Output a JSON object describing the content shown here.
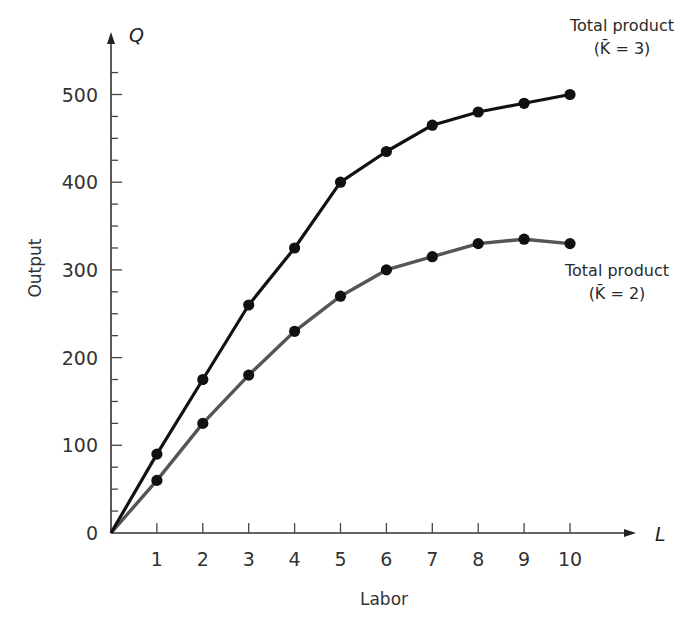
{
  "chart_data": {
    "type": "line",
    "title": "",
    "xlabel": "Labor",
    "ylabel": "Output",
    "x_axis_symbol": "L",
    "y_axis_symbol": "Q",
    "x": [
      1,
      2,
      3,
      4,
      5,
      6,
      7,
      8,
      9,
      10
    ],
    "xticks": [
      "1",
      "2",
      "3",
      "4",
      "5",
      "6",
      "7",
      "8",
      "9",
      "10"
    ],
    "yticks": [
      "0",
      "100",
      "200",
      "300",
      "400",
      "500"
    ],
    "y_minor_tick_step": 25,
    "xlim": [
      0,
      10.8
    ],
    "ylim": [
      0,
      555
    ],
    "grid": false,
    "legend_position": "inline-right",
    "series": [
      {
        "name": "Total product (K̄ = 3)",
        "label_line1": "Total product",
        "label_line2": "(K̄ = 3)",
        "color": "#111111",
        "marker": "circle",
        "values": [
          90,
          175,
          260,
          325,
          400,
          435,
          465,
          480,
          490,
          500
        ]
      },
      {
        "name": "Total product (K̄ = 2)",
        "label_line1": "Total product",
        "label_line2": "(K̄ = 2)",
        "color": "#555555",
        "marker": "circle",
        "values": [
          60,
          125,
          180,
          230,
          270,
          300,
          315,
          330,
          335,
          330
        ]
      }
    ]
  }
}
